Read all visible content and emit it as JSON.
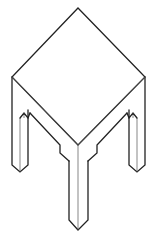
{
  "figure": {
    "subject": "Isometric line drawing of a square table with four legs",
    "caption": "",
    "colors": {
      "background": "#ffffff",
      "outline": "#222222",
      "inner_edge": "#555555"
    },
    "parts": {
      "top": "table-top",
      "apron": "apron",
      "legs": [
        "front-leg",
        "left-leg",
        "right-leg",
        "back-leg-hidden"
      ]
    }
  }
}
